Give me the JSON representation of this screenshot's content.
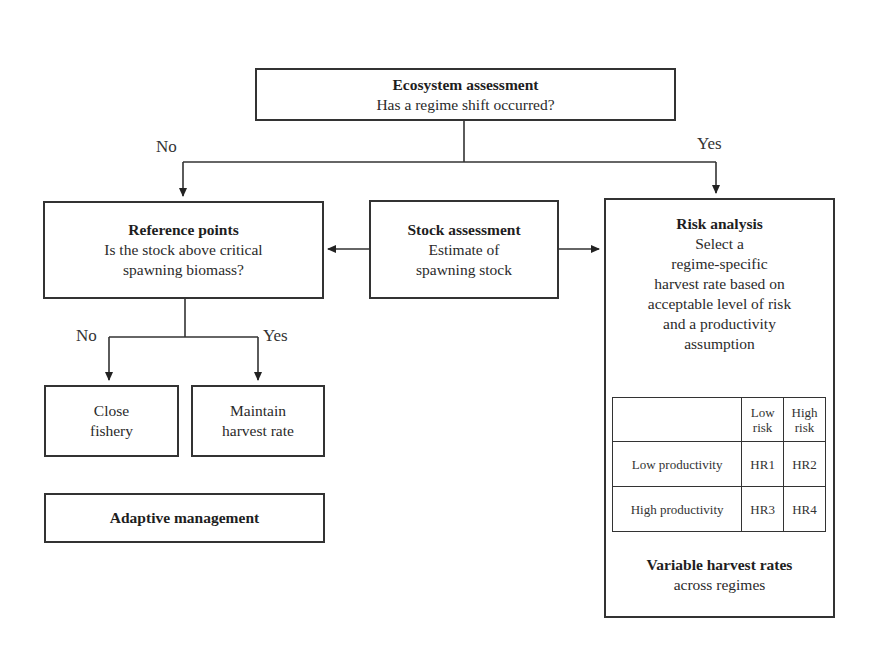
{
  "diagram": {
    "ecosystem": {
      "title": "Ecosystem assessment",
      "question": "Has a regime shift occurred?"
    },
    "branch_labels": {
      "no": "No",
      "yes": "Yes"
    },
    "reference": {
      "title": "Reference points",
      "line1": "Is the stock above critical",
      "line2": "spawning biomass?"
    },
    "stock": {
      "title": "Stock assessment",
      "line1": "Estimate of",
      "line2": "spawning stock"
    },
    "risk": {
      "title": "Risk analysis",
      "lines": [
        "Select a",
        "regime-specific",
        "harvest rate based on",
        "acceptable level of risk",
        "and a productivity",
        "assumption"
      ],
      "table": {
        "headers": [
          "",
          "Low risk",
          "High risk"
        ],
        "header_lines": {
          "low": [
            "Low",
            "risk"
          ],
          "high": [
            "High",
            "risk"
          ]
        },
        "rows": [
          {
            "label": "Low productivity",
            "low": "HR1",
            "high": "HR2"
          },
          {
            "label": "High productivity",
            "low": "HR3",
            "high": "HR4"
          }
        ]
      },
      "footer_title": "Variable harvest rates",
      "footer_sub": "across regimes"
    },
    "sub_branch_labels": {
      "no": "No",
      "yes": "Yes"
    },
    "close": {
      "line1": "Close",
      "line2": "fishery"
    },
    "maintain": {
      "line1": "Maintain",
      "line2": "harvest rate"
    },
    "adaptive": {
      "title": "Adaptive management"
    }
  }
}
